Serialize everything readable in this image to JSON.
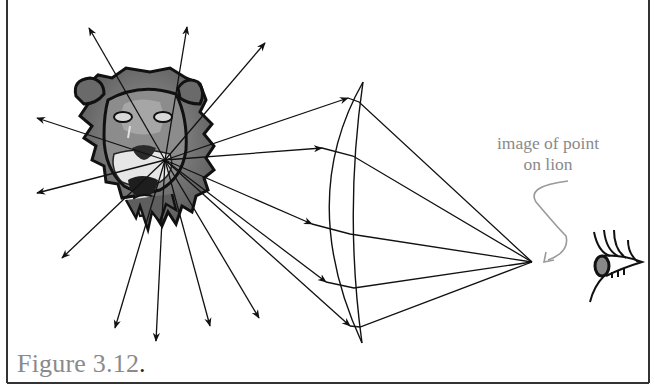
{
  "figure": {
    "caption": "Figure 3.12",
    "caption_period": ".",
    "annotation_line1": "image of point",
    "annotation_line2": "on lion"
  },
  "diagram": {
    "elements": [
      "lion-head",
      "point-source-rays",
      "lens",
      "image-point",
      "eye"
    ],
    "point_source": {
      "x": 165,
      "y": 160
    },
    "image_point": {
      "x": 532,
      "y": 262
    },
    "ray_count_outward": 14,
    "ray_count_through_lens": 5,
    "colors": {
      "lines": "#111111",
      "annotation": "#8a8a8a",
      "lion_fill": "#7a7a7a",
      "frame": "#333333"
    }
  }
}
